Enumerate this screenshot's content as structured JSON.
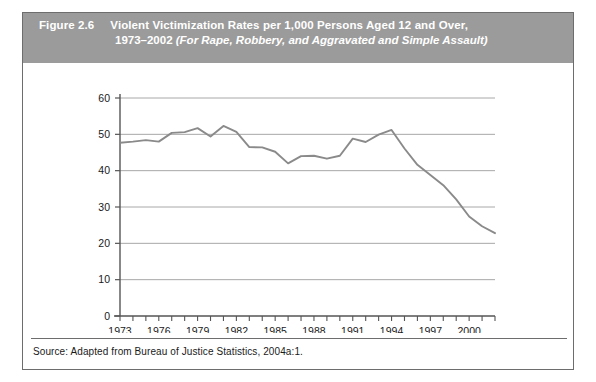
{
  "figure": {
    "number_label": "Figure 2.6",
    "title_main": "Violent Victimization Rates per 1,000 Persons Aged 12 and Over,",
    "title_years": "1973–2002 ",
    "title_subtitle": "(For Rape, Robbery, and Aggravated and Simple Assault)",
    "source": "Source: Adapted from Bureau of Justice Statistics, 2004a:1."
  },
  "colors": {
    "header_background": "#9b9b9b",
    "header_text": "#ffffff",
    "frame_border": "#6d6d6d",
    "gridline": "#a8a8a8",
    "axis": "#555555",
    "series_line": "#8a8a8a",
    "tick_text": "#1a1a1a",
    "page_background": "#ffffff"
  },
  "chart_data": {
    "type": "line",
    "title": "Violent Victimization Rates per 1,000 Persons Aged 12 and Over, 1973–2002",
    "xlabel": "",
    "ylabel": "",
    "grid": true,
    "legend": "none",
    "xlim": [
      1973,
      2002
    ],
    "ylim": [
      0,
      60
    ],
    "ytick_values": [
      0,
      10,
      20,
      30,
      40,
      50,
      60
    ],
    "ytick_labels": [
      "0",
      "10",
      "20",
      "30",
      "40",
      "50",
      "60"
    ],
    "xtick_values": [
      1973,
      1974,
      1975,
      1976,
      1977,
      1978,
      1979,
      1980,
      1981,
      1982,
      1983,
      1984,
      1985,
      1986,
      1987,
      1988,
      1989,
      1990,
      1991,
      1992,
      1993,
      1994,
      1995,
      1996,
      1997,
      1998,
      1999,
      2000,
      2001,
      2002
    ],
    "xtick_labels_shown": [
      "1973",
      "1976",
      "1979",
      "1982",
      "1985",
      "1988",
      "1991",
      "1994",
      "1997",
      "2000"
    ],
    "xtick_label_values": [
      1973,
      1976,
      1979,
      1982,
      1985,
      1988,
      1991,
      1994,
      1997,
      2000
    ],
    "x": [
      1973,
      1974,
      1975,
      1976,
      1977,
      1978,
      1979,
      1980,
      1981,
      1982,
      1983,
      1984,
      1985,
      1986,
      1987,
      1988,
      1989,
      1990,
      1991,
      1992,
      1993,
      1994,
      1995,
      1996,
      1997,
      1998,
      1999,
      2000,
      2001,
      2002
    ],
    "values": [
      47.7,
      48.0,
      48.4,
      48.0,
      50.4,
      50.6,
      51.7,
      49.4,
      52.3,
      50.7,
      46.5,
      46.4,
      45.2,
      42.0,
      44.0,
      44.1,
      43.3,
      44.1,
      48.8,
      47.9,
      49.9,
      51.2,
      46.1,
      41.6,
      38.8,
      36.0,
      32.1,
      27.4,
      24.7,
      22.8
    ]
  }
}
